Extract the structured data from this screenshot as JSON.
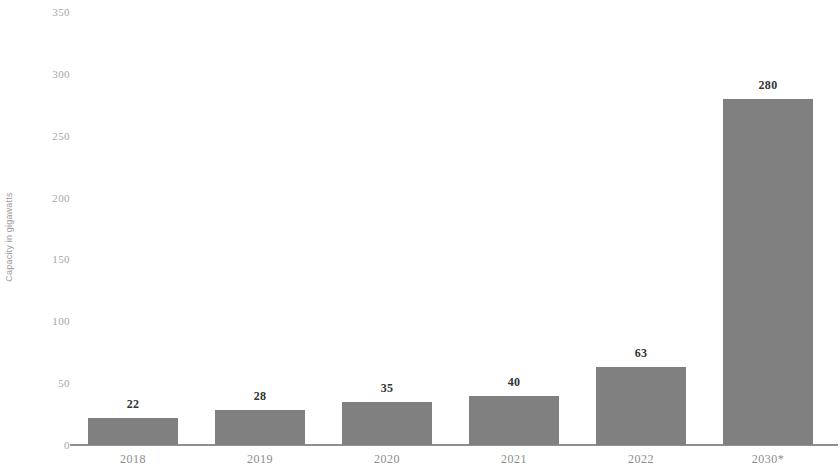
{
  "chart_data": {
    "type": "bar",
    "title": "",
    "subtitle": "",
    "xlabel": "",
    "ylabel": "Capacity in gigawatts",
    "categories": [
      "2018",
      "2019",
      "2020",
      "2021",
      "2022",
      "2030*"
    ],
    "values": [
      22,
      28,
      35,
      40,
      63,
      280
    ],
    "data_labels": [
      "22",
      "28",
      "35",
      "40",
      "63",
      "280"
    ],
    "ylim": [
      0,
      350
    ],
    "y_ticks": [
      0,
      50,
      100,
      150,
      200,
      250,
      300,
      350
    ],
    "y_tick_labels": [
      "0",
      "50",
      "100",
      "150",
      "200",
      "250",
      "300",
      "350"
    ],
    "grid": false,
    "legend": null,
    "legend_position": "none",
    "annotations": [],
    "series": [
      {
        "name": "Capacity",
        "values": [
          22,
          28,
          35,
          40,
          63,
          280
        ],
        "color": "#808080"
      }
    ],
    "colors": {
      "bar": "#808080",
      "axis": "#8f8f8f",
      "tick_label": "#a6a6a6",
      "category_label": "#8c8c8c",
      "data_label": "#333333",
      "axis_title": "#9a9a9a",
      "background": "#ffffff"
    }
  }
}
